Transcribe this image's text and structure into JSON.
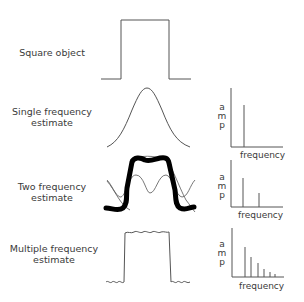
{
  "rows": [
    {
      "label_line1": "Square object",
      "label_line2": ""
    },
    {
      "label_line1": "Single frequency",
      "label_line2": "estimate"
    },
    {
      "label_line1": "Two frequency",
      "label_line2": "estimate"
    },
    {
      "label_line1": "Multiple frequency",
      "label_line2": "estimate"
    }
  ],
  "spectra": [
    {
      "ylabel": [
        "a",
        "m",
        "p"
      ],
      "xlabel": "frequency",
      "bars": [
        1
      ]
    },
    {
      "ylabel": [
        "a",
        "m",
        "p"
      ],
      "xlabel": "frequency",
      "bars": [
        1,
        0.5
      ]
    },
    {
      "ylabel": [
        "a",
        "m",
        "p"
      ],
      "xlabel": "frequency",
      "bars": [
        1,
        0.7,
        0.5,
        0.3,
        0.18,
        0.08
      ]
    }
  ],
  "colors": {
    "line": "#555555",
    "thick": "#000000",
    "text": "#3a3a3a"
  }
}
